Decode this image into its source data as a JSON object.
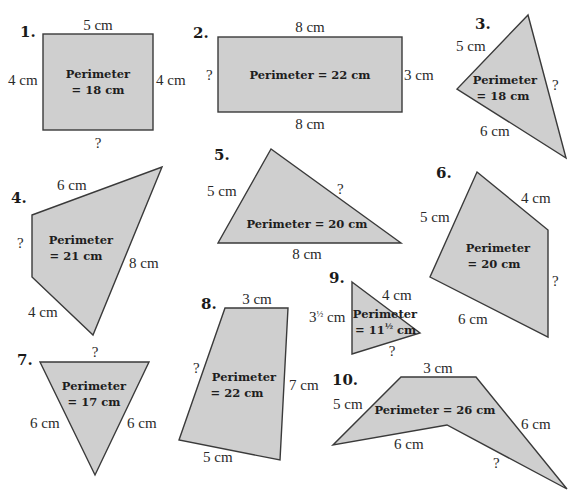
{
  "problems": [
    {
      "number": "1.",
      "shape": "rectangle",
      "perimeter_line1": "Perimeter",
      "perimeter_line2": "= 18 cm",
      "sides": {
        "top": "5 cm",
        "left": "4 cm",
        "right": "4 cm",
        "bottom": "?"
      }
    },
    {
      "number": "2.",
      "shape": "rectangle",
      "perimeter": "Perimeter = 22 cm",
      "sides": {
        "top": "8 cm",
        "left": "?",
        "right": "3 cm",
        "bottom": "8 cm"
      }
    },
    {
      "number": "3.",
      "shape": "triangle",
      "perimeter_line1": "Perimeter",
      "perimeter_line2": "= 18 cm",
      "sides": {
        "upper_left": "5 cm",
        "right": "?",
        "lower_left": "6 cm"
      }
    },
    {
      "number": "4.",
      "shape": "quadrilateral",
      "perimeter_line1": "Perimeter",
      "perimeter_line2": "= 21 cm",
      "sides": {
        "top": "6 cm",
        "left": "?",
        "right": "8 cm",
        "bottom_left": "4 cm"
      }
    },
    {
      "number": "5.",
      "shape": "triangle",
      "perimeter": "Perimeter = 20 cm",
      "sides": {
        "left": "5 cm",
        "right": "?",
        "bottom": "8 cm"
      }
    },
    {
      "number": "6.",
      "shape": "quadrilateral",
      "perimeter_line1": "Perimeter",
      "perimeter_line2": "= 20 cm",
      "sides": {
        "upper_left": "5 cm",
        "upper_right": "4 cm",
        "right": "?",
        "bottom": "6 cm"
      }
    },
    {
      "number": "7.",
      "shape": "triangle",
      "perimeter_line1": "Perimeter",
      "perimeter_line2": "= 17 cm",
      "sides": {
        "top": "?",
        "left": "6 cm",
        "right": "6 cm"
      }
    },
    {
      "number": "8.",
      "shape": "quadrilateral",
      "perimeter_line1": "Perimeter",
      "perimeter_line2": "= 22 cm",
      "sides": {
        "top": "3 cm",
        "left": "?",
        "right": "7 cm",
        "bottom": "5 cm"
      }
    },
    {
      "number": "9.",
      "shape": "triangle",
      "perimeter_line1": "Perimeter",
      "perimeter_line2_prefix": "= 11",
      "perimeter_line2_frac": "½",
      "perimeter_line2_suffix": " cm",
      "sides": {
        "left_whole": "3",
        "left_frac": "½",
        "left_unit": " cm",
        "upper_right": "4 cm",
        "bottom": "?"
      }
    },
    {
      "number": "10.",
      "shape": "concave-quadrilateral",
      "perimeter": "Perimeter = 26 cm",
      "sides": {
        "top": "3 cm",
        "upper_left": "5 cm",
        "right": "6 cm",
        "inner_left": "6 cm",
        "inner_right": "?"
      }
    }
  ],
  "colors": {
    "fill": "#cfcfcf",
    "stroke": "#3a3a3a",
    "text": "#1a1a1a"
  }
}
